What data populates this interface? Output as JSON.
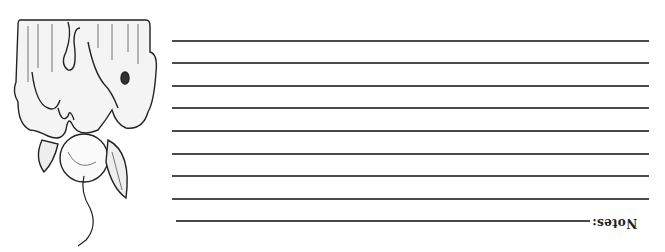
{
  "card": {
    "notes_label": "Notes:",
    "orientation": "upside-down",
    "illustration": "melting-wax-apple-drawing",
    "line_color": "#4a4a4a",
    "lines": [
      {
        "y": 40,
        "x1": 172,
        "x2": 649
      },
      {
        "y": 62,
        "x1": 172,
        "x2": 649
      },
      {
        "y": 85,
        "x1": 172,
        "x2": 649
      },
      {
        "y": 107,
        "x1": 172,
        "x2": 649
      },
      {
        "y": 130,
        "x1": 172,
        "x2": 649
      },
      {
        "y": 153,
        "x1": 172,
        "x2": 649
      },
      {
        "y": 175,
        "x1": 172,
        "x2": 649
      },
      {
        "y": 198,
        "x1": 172,
        "x2": 649
      },
      {
        "y": 220,
        "x1": 176,
        "x2": 590
      }
    ]
  }
}
